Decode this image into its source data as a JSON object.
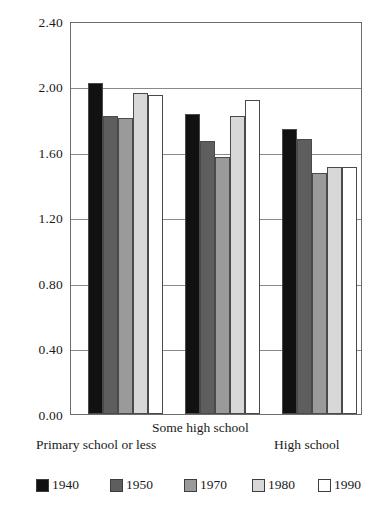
{
  "chart_data": {
    "type": "bar",
    "title": "",
    "subtitle": "",
    "xlabel": "",
    "ylabel": "",
    "categories": [
      "Primary school or less",
      "Some high school",
      "High school"
    ],
    "series": [
      {
        "name": "1940",
        "color": "#111111",
        "values": [
          2.02,
          1.83,
          1.74
        ]
      },
      {
        "name": "1950",
        "color": "#5e5e5e",
        "values": [
          1.82,
          1.67,
          1.68
        ]
      },
      {
        "name": "1970",
        "color": "#9a9a9a",
        "values": [
          1.81,
          1.57,
          1.47
        ]
      },
      {
        "name": "1980",
        "color": "#d8d8d8",
        "values": [
          1.96,
          1.82,
          1.51
        ]
      },
      {
        "name": "1990",
        "color": "#ffffff",
        "values": [
          1.95,
          1.92,
          1.51
        ]
      }
    ],
    "ylim": [
      0.0,
      2.4
    ],
    "yticks": [
      "0.00",
      "0.40",
      "0.80",
      "1.20",
      "1.60",
      "2.00",
      "2.40"
    ],
    "ytick_values": [
      0.0,
      0.4,
      0.8,
      1.2,
      1.6,
      2.0,
      2.4
    ],
    "grid": true,
    "legend_position": "bottom"
  },
  "legend": {
    "items": [
      {
        "label": "1940"
      },
      {
        "label": "1950"
      },
      {
        "label": "1970"
      },
      {
        "label": "1980"
      },
      {
        "label": "1990"
      }
    ]
  },
  "axis": {
    "y_labels": [
      "2.40",
      "2.00",
      "1.60",
      "1.20",
      "0.80",
      "0.40",
      "0.00"
    ]
  },
  "categories": {
    "primary": "Primary school or less",
    "some_high": "Some high school",
    "high": "High school"
  }
}
